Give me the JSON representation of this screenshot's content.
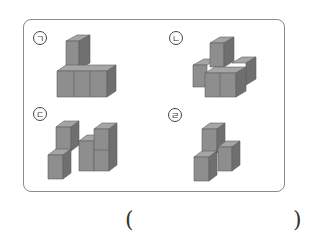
{
  "question": {
    "options": [
      {
        "marker": "ㄱ",
        "description": "L-shape: 3 cubes in a row with 1 cube stacked on the left end"
      },
      {
        "marker": "ㄴ",
        "description": "4 cubes in bottom layer with 1 cube stacked on top at the back"
      },
      {
        "marker": "ㄷ",
        "description": "Two-tower shape: left column of 2 cubes, middle cube, right column of 2 cubes"
      },
      {
        "marker": "ㄹ",
        "description": "3 cubes: 1 stacked on 1 with 1 beside"
      }
    ],
    "answer_blank": {
      "open": "(",
      "close": ")"
    }
  },
  "colors": {
    "cube_top": "#a5a5a5",
    "cube_front": "#8e8e8e",
    "cube_side": "#6f6f6f",
    "frame": "#8a8a8a"
  }
}
